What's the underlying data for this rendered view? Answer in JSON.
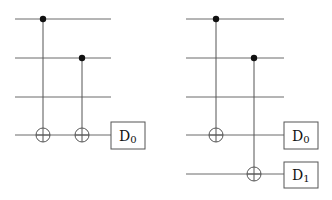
{
  "diagram": {
    "type": "quantum-circuit",
    "circuits": [
      {
        "name": "left-circuit",
        "wires_y": [
          19,
          58,
          97,
          135
        ],
        "wire_x_start": 15,
        "wire_x_end": 111,
        "gates": [
          {
            "type": "cnot",
            "x": 43,
            "control_y": 19,
            "target_y": 135
          },
          {
            "type": "cnot",
            "x": 82,
            "control_y": 58,
            "target_y": 135
          }
        ],
        "detectors": [
          {
            "label_main": "D",
            "label_sub": "0",
            "wire_y": 135
          }
        ]
      },
      {
        "name": "right-circuit",
        "wires_y": [
          19,
          58,
          97,
          135,
          174
        ],
        "wire_x_start": 186,
        "wire_x_end": 284,
        "gates": [
          {
            "type": "cnot",
            "x": 216,
            "control_y": 19,
            "target_y": 135
          },
          {
            "type": "cnot",
            "x": 254,
            "control_y": 58,
            "target_y": 174
          }
        ],
        "detectors": [
          {
            "label_main": "D",
            "label_sub": "0",
            "wire_y": 135
          },
          {
            "label_main": "D",
            "label_sub": "1",
            "wire_y": 174
          }
        ]
      }
    ],
    "colors": {
      "wire": "#6a6a6a",
      "dot": "#111111",
      "box": "#555555"
    }
  }
}
